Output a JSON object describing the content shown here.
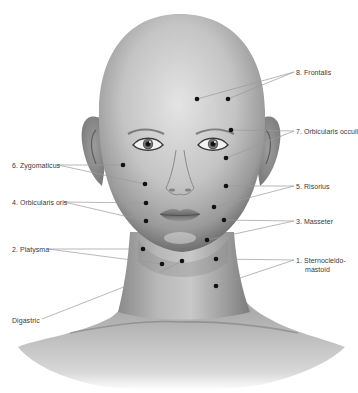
{
  "figure": {
    "colors": {
      "background": "#ffffff",
      "skin_light": "#d9d9d9",
      "skin_mid": "#a8a8a8",
      "skin_dark": "#6f6f6f",
      "leader_line": "#9a9a9a",
      "dot": "#111111",
      "label_text": "#3a3a3a"
    }
  },
  "labels": [
    {
      "id": "frontalis",
      "text": "8. Frontalis",
      "side": "right",
      "x": 296,
      "y": 68
    },
    {
      "id": "orbicularis-oculi",
      "text": "7. Orbicularis occuli",
      "side": "right",
      "x": 296,
      "y": 127
    },
    {
      "id": "zygomaticus",
      "text": "6. Zygomaticus",
      "side": "left",
      "x": 12,
      "y": 161
    },
    {
      "id": "risorius",
      "text": "5. Risorius",
      "side": "right",
      "x": 296,
      "y": 182
    },
    {
      "id": "orbicularis-oris",
      "text": "4. Orbicularis oris",
      "side": "left",
      "x": 12,
      "y": 198
    },
    {
      "id": "masseter",
      "text": "3. Masseter",
      "side": "right",
      "x": 296,
      "y": 217
    },
    {
      "id": "platysma",
      "text": "2. Platysma",
      "side": "left",
      "x": 12,
      "y": 245
    },
    {
      "id": "sternocleidomastoid",
      "text": "1. Sternocleido-",
      "text2": "mastoid",
      "side": "right",
      "x": 296,
      "y": 256
    },
    {
      "id": "digastric",
      "text": "Digastric",
      "side": "left",
      "x": 12,
      "y": 316
    }
  ],
  "injection_points": [
    {
      "muscle": "frontalis",
      "x": 197,
      "y": 99
    },
    {
      "muscle": "frontalis",
      "x": 228,
      "y": 99
    },
    {
      "muscle": "orbicularis-oculi",
      "x": 231,
      "y": 130
    },
    {
      "muscle": "orbicularis-oculi",
      "x": 226,
      "y": 158
    },
    {
      "muscle": "zygomaticus",
      "x": 123,
      "y": 165
    },
    {
      "muscle": "zygomaticus",
      "x": 145,
      "y": 184
    },
    {
      "muscle": "risorius",
      "x": 226,
      "y": 186
    },
    {
      "muscle": "orbicularis-oris",
      "x": 146,
      "y": 203
    },
    {
      "muscle": "orbicularis-oris",
      "x": 146,
      "y": 221
    },
    {
      "muscle": "masseter",
      "x": 214,
      "y": 207
    },
    {
      "muscle": "masseter",
      "x": 224,
      "y": 220
    },
    {
      "muscle": "masseter",
      "x": 207,
      "y": 240
    },
    {
      "muscle": "platysma",
      "x": 143,
      "y": 249
    },
    {
      "muscle": "platysma",
      "x": 162,
      "y": 264
    },
    {
      "muscle": "platysma",
      "x": 182,
      "y": 261
    },
    {
      "muscle": "sternocleidomastoid",
      "x": 216,
      "y": 259
    },
    {
      "muscle": "sternocleidomastoid",
      "x": 216,
      "y": 286
    }
  ]
}
